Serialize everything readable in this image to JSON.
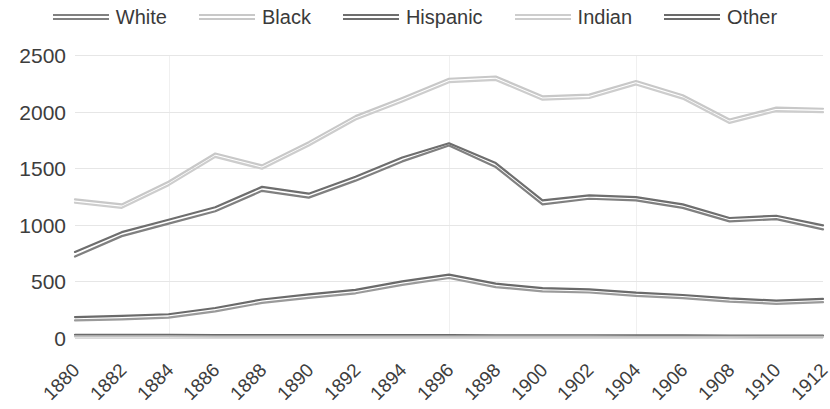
{
  "legend": {
    "position": "top",
    "items": [
      {
        "label": "White",
        "color": "#808080",
        "icon": "line-swatch-icon"
      },
      {
        "label": "Black",
        "color": "#c8c8c8",
        "icon": "line-swatch-icon"
      },
      {
        "label": "Hispanic",
        "color": "#6e6e6e",
        "icon": "line-swatch-icon"
      },
      {
        "label": "Indian",
        "color": "#cdcdcd",
        "icon": "line-swatch-icon"
      },
      {
        "label": "Other",
        "color": "#6a6a6a",
        "icon": "line-swatch-icon"
      }
    ]
  },
  "axes": {
    "y_ticks": [
      "2500",
      "2000",
      "1500",
      "1000",
      "500",
      "0"
    ],
    "x_ticks": [
      "1880",
      "1882",
      "1884",
      "1886",
      "1888",
      "1890",
      "1892",
      "1894",
      "1896",
      "1898",
      "1900",
      "1902",
      "1904",
      "1906",
      "1908",
      "1910",
      "1912"
    ]
  },
  "chart_data": {
    "type": "line",
    "title": "",
    "xlabel": "",
    "ylabel": "",
    "ylim": [
      0,
      2500
    ],
    "ytick_step": 500,
    "grid": true,
    "legend_position": "top",
    "x": [
      1880,
      1882,
      1884,
      1886,
      1888,
      1890,
      1892,
      1894,
      1896,
      1898,
      1900,
      1902,
      1904,
      1906,
      1908,
      1910,
      1912
    ],
    "series": [
      {
        "name": "White",
        "color": "#808080",
        "values": [
          720,
          900,
          1010,
          1120,
          1300,
          1240,
          1390,
          1560,
          1700,
          1510,
          1180,
          1230,
          1215,
          1150,
          1030,
          1050,
          960
        ]
      },
      {
        "name": "Black",
        "color": "#c8c8c8",
        "values": [
          1225,
          1180,
          1380,
          1630,
          1525,
          1730,
          1960,
          2120,
          2290,
          2310,
          2135,
          2150,
          2270,
          2145,
          1930,
          2035,
          2025
        ]
      },
      {
        "name": "Hispanic",
        "color": "#6e6e6e",
        "values": [
          760,
          935,
          1045,
          1155,
          1335,
          1275,
          1425,
          1595,
          1720,
          1545,
          1215,
          1260,
          1245,
          1180,
          1060,
          1080,
          995
        ]
      },
      {
        "name": "Indian",
        "color": "#cdcdcd",
        "values": [
          1195,
          1150,
          1350,
          1600,
          1495,
          1700,
          1930,
          2090,
          2260,
          2280,
          2105,
          2120,
          2240,
          2115,
          1900,
          2005,
          1995
        ]
      },
      {
        "name": "Other",
        "color": "#6a6a6a",
        "values": [
          185,
          195,
          210,
          265,
          340,
          385,
          425,
          500,
          560,
          480,
          440,
          430,
          400,
          380,
          350,
          330,
          345
        ]
      },
      {
        "name": "Other-baseline",
        "color": "#6a6a6a",
        "values": [
          28,
          27,
          27,
          26,
          26,
          26,
          25,
          25,
          25,
          24,
          24,
          24,
          23,
          23,
          22,
          22,
          22
        ]
      },
      {
        "name": "Other-baseline-lower",
        "color": "#c0c0c0",
        "values": [
          14,
          14,
          14,
          13,
          13,
          13,
          13,
          12,
          12,
          12,
          12,
          12,
          11,
          11,
          11,
          10,
          10
        ]
      },
      {
        "name": "Other-upper",
        "color": "#9a9a9a",
        "values": [
          155,
          165,
          180,
          235,
          310,
          355,
          395,
          470,
          530,
          450,
          412,
          402,
          372,
          352,
          322,
          302,
          317
        ]
      }
    ]
  }
}
